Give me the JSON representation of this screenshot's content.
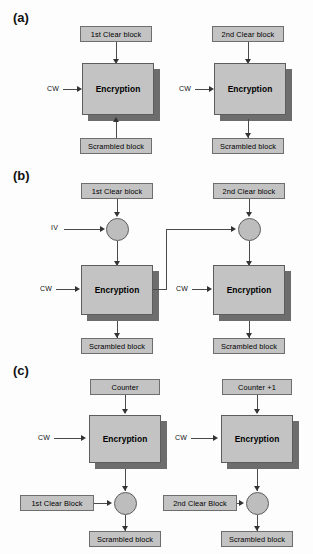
{
  "figure": {
    "background_color": "#fdfdfd",
    "box_fill": "#c3c3c3",
    "box_border": "#6e6e6e",
    "shadow_color": "#6d6d6d",
    "line_color": "#4a4a4a"
  },
  "sections": [
    {
      "label": "(a)",
      "name": "ecb-mode",
      "columns": [
        {
          "input_label": "1st Clear block",
          "key_label": "CW",
          "cipher_label": "Encryption",
          "output_label": "Scrambled block"
        },
        {
          "input_label": "2nd Clear block",
          "key_label": "CW",
          "cipher_label": "Encryption",
          "output_label": "Scrambled block"
        }
      ]
    },
    {
      "label": "(b)",
      "name": "cbc-mode",
      "columns": [
        {
          "input_label": "1st Clear block",
          "iv_label": "IV",
          "key_label": "CW",
          "cipher_label": "Encryption",
          "output_label": "Scrambled block"
        },
        {
          "input_label": "2nd Clear block",
          "key_label": "CW",
          "cipher_label": "Encryption",
          "output_label": "Scrambled block"
        }
      ]
    },
    {
      "label": "(c)",
      "name": "counter-mode",
      "columns": [
        {
          "input_label": "Counter",
          "key_label": "CW",
          "cipher_label": "Encryption",
          "clear_label": "1st Clear Block",
          "output_label": "Scrambled block"
        },
        {
          "input_label": "Counter +1",
          "key_label": "CW",
          "cipher_label": "Encryption",
          "clear_label": "2nd Clear Block",
          "output_label": "Scrambled block"
        }
      ]
    }
  ]
}
